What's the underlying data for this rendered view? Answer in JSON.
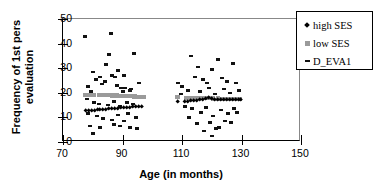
{
  "chart_data": {
    "type": "scatter",
    "title": "",
    "xlabel": "Age (in months)",
    "ylabel": "Frequency of 1st pers evaluation",
    "ylabel_line1": "Frequency of 1st pers",
    "ylabel_line2": "evaluation",
    "xlim": [
      70,
      150
    ],
    "ylim": [
      0,
      50
    ],
    "xticks": [
      70,
      90,
      110,
      130,
      150
    ],
    "yticks": [
      0,
      10,
      20,
      30,
      40,
      50
    ],
    "grid": false,
    "legend_position": "right-outside",
    "legend": [
      "high SES",
      "low SES",
      "D_EVA1"
    ],
    "colors": {
      "high_SES": "#000000",
      "low_SES": "#9a9a9a",
      "D_EVA1": "#111111",
      "axis": "#000000",
      "frame": "#888888",
      "background": "#ffffff"
    },
    "series": [
      {
        "name": "D_EVA1",
        "marker": "dash",
        "color": "#111111",
        "points": [
          [
            77.5,
            43
          ],
          [
            80.0,
            28.5
          ],
          [
            81.0,
            25.5
          ],
          [
            82.5,
            26.5
          ],
          [
            84.5,
            31.5
          ],
          [
            85.5,
            35.5
          ],
          [
            86.0,
            44
          ],
          [
            86.5,
            27.0
          ],
          [
            87.5,
            26.5
          ],
          [
            88.5,
            29.0
          ],
          [
            90.5,
            27.0
          ],
          [
            91.0,
            22.0
          ],
          [
            92.5,
            21.0
          ],
          [
            94.0,
            36.0
          ],
          [
            95.5,
            24.0
          ],
          [
            78.5,
            22.5
          ],
          [
            79.5,
            20.5
          ],
          [
            83.0,
            23.5
          ],
          [
            84.0,
            24.5
          ],
          [
            88.0,
            23.0
          ],
          [
            89.5,
            22.0
          ],
          [
            90.0,
            20.5
          ],
          [
            93.0,
            21.5
          ],
          [
            78.0,
            17.5
          ],
          [
            80.5,
            16.0
          ],
          [
            82.0,
            15.5
          ],
          [
            85.0,
            15.0
          ],
          [
            87.0,
            16.5
          ],
          [
            89.0,
            14.5
          ],
          [
            91.5,
            16.0
          ],
          [
            93.5,
            15.5
          ],
          [
            78.5,
            11.5
          ],
          [
            81.5,
            10.5
          ],
          [
            83.5,
            9.5
          ],
          [
            86.5,
            9.0
          ],
          [
            88.5,
            11.0
          ],
          [
            90.5,
            8.5
          ],
          [
            92.0,
            11.5
          ],
          [
            94.5,
            10.0
          ],
          [
            79.0,
            6.5
          ],
          [
            80.0,
            3.5
          ],
          [
            82.5,
            6.0
          ],
          [
            87.0,
            7.0
          ],
          [
            89.0,
            6.5
          ],
          [
            92.5,
            6.0
          ],
          [
            95.0,
            5.5
          ],
          [
            108.5,
            24.0
          ],
          [
            110.0,
            22.5
          ],
          [
            113.0,
            35.0
          ],
          [
            114.5,
            26.5
          ],
          [
            115.5,
            30.5
          ],
          [
            117.0,
            25.5
          ],
          [
            118.5,
            24.0
          ],
          [
            120.0,
            29.5
          ],
          [
            122.0,
            33.5
          ],
          [
            123.5,
            26.0
          ],
          [
            125.0,
            24.5
          ],
          [
            127.0,
            32.0
          ],
          [
            128.0,
            24.0
          ],
          [
            129.0,
            21.0
          ],
          [
            109.5,
            19.5
          ],
          [
            112.0,
            21.0
          ],
          [
            116.0,
            20.5
          ],
          [
            119.0,
            22.0
          ],
          [
            121.0,
            19.5
          ],
          [
            124.0,
            21.5
          ],
          [
            126.0,
            20.0
          ],
          [
            111.0,
            14.5
          ],
          [
            113.5,
            13.5
          ],
          [
            116.5,
            12.0
          ],
          [
            118.0,
            14.0
          ],
          [
            120.5,
            10.5
          ],
          [
            123.0,
            13.0
          ],
          [
            125.5,
            11.5
          ],
          [
            127.5,
            13.5
          ],
          [
            112.5,
            10.0
          ],
          [
            115.0,
            7.5
          ],
          [
            119.5,
            8.0
          ],
          [
            121.5,
            5.5
          ],
          [
            124.5,
            8.5
          ],
          [
            126.5,
            8.0
          ],
          [
            128.5,
            12.0
          ],
          [
            117.5,
            4.5
          ],
          [
            120.0,
            2.5
          ],
          [
            122.5,
            6.0
          ]
        ]
      },
      {
        "name": "low SES",
        "marker": "square",
        "color": "#9a9a9a",
        "trend_note": "near-horizontal band",
        "points": [
          [
            77.5,
            19.2
          ],
          [
            79.0,
            19.2
          ],
          [
            80.5,
            19.1
          ],
          [
            82.0,
            19.1
          ],
          [
            83.5,
            19.0
          ],
          [
            85.0,
            19.0
          ],
          [
            86.5,
            18.9
          ],
          [
            88.0,
            18.9
          ],
          [
            89.5,
            18.8
          ],
          [
            91.0,
            18.7
          ],
          [
            92.5,
            18.6
          ],
          [
            94.0,
            18.5
          ],
          [
            95.5,
            18.4
          ],
          [
            97.0,
            18.3
          ],
          [
            108.5,
            18.2
          ],
          [
            111.5,
            18.0
          ],
          [
            113.0,
            18.0
          ],
          [
            114.5,
            17.9
          ],
          [
            116.0,
            17.9
          ],
          [
            117.5,
            17.8
          ],
          [
            119.0,
            17.8
          ],
          [
            120.5,
            17.7
          ],
          [
            122.0,
            17.7
          ],
          [
            123.5,
            17.6
          ],
          [
            125.0,
            17.6
          ],
          [
            126.5,
            17.5
          ],
          [
            128.0,
            17.5
          ],
          [
            129.5,
            17.4
          ]
        ]
      },
      {
        "name": "high SES",
        "marker": "diamond",
        "color": "#000000",
        "trend_note": "near-horizontal band",
        "points": [
          [
            77.5,
            12.6
          ],
          [
            78.5,
            12.7
          ],
          [
            79.5,
            12.8
          ],
          [
            80.5,
            12.9
          ],
          [
            81.5,
            13.0
          ],
          [
            82.5,
            13.1
          ],
          [
            83.5,
            13.2
          ],
          [
            84.5,
            13.3
          ],
          [
            85.5,
            13.4
          ],
          [
            86.5,
            13.5
          ],
          [
            87.5,
            13.6
          ],
          [
            88.5,
            13.7
          ],
          [
            89.5,
            13.8
          ],
          [
            90.5,
            13.9
          ],
          [
            91.5,
            14.0
          ],
          [
            92.5,
            14.1
          ],
          [
            93.5,
            14.2
          ],
          [
            94.5,
            14.3
          ],
          [
            95.5,
            14.4
          ],
          [
            96.5,
            14.5
          ],
          [
            108.5,
            16.2
          ],
          [
            111.0,
            16.4
          ],
          [
            112.0,
            16.5
          ],
          [
            113.0,
            16.6
          ],
          [
            114.0,
            16.7
          ],
          [
            115.0,
            16.8
          ],
          [
            116.0,
            17.0
          ],
          [
            117.0,
            17.2
          ],
          [
            118.0,
            17.6
          ],
          [
            119.0,
            18.2
          ],
          [
            120.0,
            17.4
          ],
          [
            121.0,
            17.2
          ],
          [
            122.0,
            17.1
          ],
          [
            123.0,
            17.0
          ],
          [
            124.0,
            17.0
          ],
          [
            125.0,
            17.0
          ],
          [
            126.0,
            17.0
          ],
          [
            127.0,
            17.0
          ],
          [
            128.0,
            17.0
          ],
          [
            129.0,
            17.0
          ],
          [
            129.8,
            17.0
          ]
        ]
      }
    ]
  }
}
